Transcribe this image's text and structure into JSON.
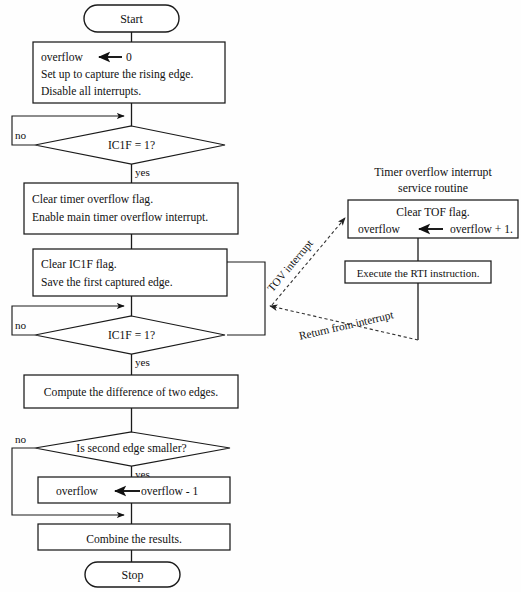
{
  "diagram": {
    "kind": "flowchart",
    "title_right_panel": [
      "Timer overflow interrupt",
      "service routine"
    ],
    "background_color": "#ffffff",
    "line_color": "#1a1a1a",
    "text_color": "#111111"
  },
  "main_flow": {
    "start_terminal": "Start",
    "stop_terminal": "Stop",
    "init_box": {
      "line1_var": "overflow",
      "line1_value": "0",
      "line2": "Set up to capture the rising edge.",
      "line3": "Disable all interrupts."
    },
    "decision1": {
      "text": "IC1F = 1?",
      "no_label": "no",
      "yes_label": "yes"
    },
    "process_enable": {
      "line1": "Clear timer overflow flag.",
      "line2": "Enable main timer overflow interrupt."
    },
    "process_capture": {
      "line1": "Clear IC1F flag.",
      "line2": "Save the first captured edge."
    },
    "decision2": {
      "text": "IC1F = 1?",
      "no_label": "no",
      "yes_label": "yes"
    },
    "process_compute": {
      "line1": "Compute the difference of two edges."
    },
    "decision3": {
      "text": "Is second edge smaller?",
      "no_label": "no",
      "yes_label": "yes"
    },
    "process_decrement": {
      "var": "overflow",
      "expression": "overflow - 1"
    },
    "process_combine": {
      "line1": "Combine the results."
    }
  },
  "isr_flow": {
    "title_line1": "Timer overflow interrupt",
    "title_line2": "service routine",
    "process_tof": {
      "line1": "Clear TOF flag.",
      "line2_var": "overflow",
      "line2_expression": "overflow + 1."
    },
    "process_rti": {
      "line1": "Execute the RTI instruction."
    },
    "edge_in_label": "TOV interrupt",
    "edge_out_label": "Return from interrupt"
  }
}
